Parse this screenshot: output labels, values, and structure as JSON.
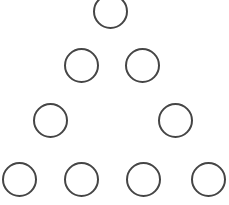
{
  "diagram": {
    "title": "",
    "background": "#ffffff",
    "stroke_color": "#454545",
    "stroke_width": 2,
    "shape": "circle",
    "arrangement": "hollow triangle of circles (4 rows: 1, 2, 2, 4)",
    "circles": [
      {
        "row": 1,
        "cx": 110,
        "cy": 11,
        "r": 17.5
      },
      {
        "row": 2,
        "cx": 81,
        "cy": 65.5,
        "r": 17.5
      },
      {
        "row": 2,
        "cx": 142.5,
        "cy": 65.5,
        "r": 17.5
      },
      {
        "row": 3,
        "cx": 50,
        "cy": 120.5,
        "r": 17.5
      },
      {
        "row": 3,
        "cx": 175,
        "cy": 120.5,
        "r": 17.5
      },
      {
        "row": 4,
        "cx": 19,
        "cy": 179,
        "r": 17.5
      },
      {
        "row": 4,
        "cx": 81.5,
        "cy": 179,
        "r": 17.5
      },
      {
        "row": 4,
        "cx": 143,
        "cy": 179,
        "r": 17.5
      },
      {
        "row": 4,
        "cx": 208,
        "cy": 179,
        "r": 17.5
      }
    ]
  }
}
